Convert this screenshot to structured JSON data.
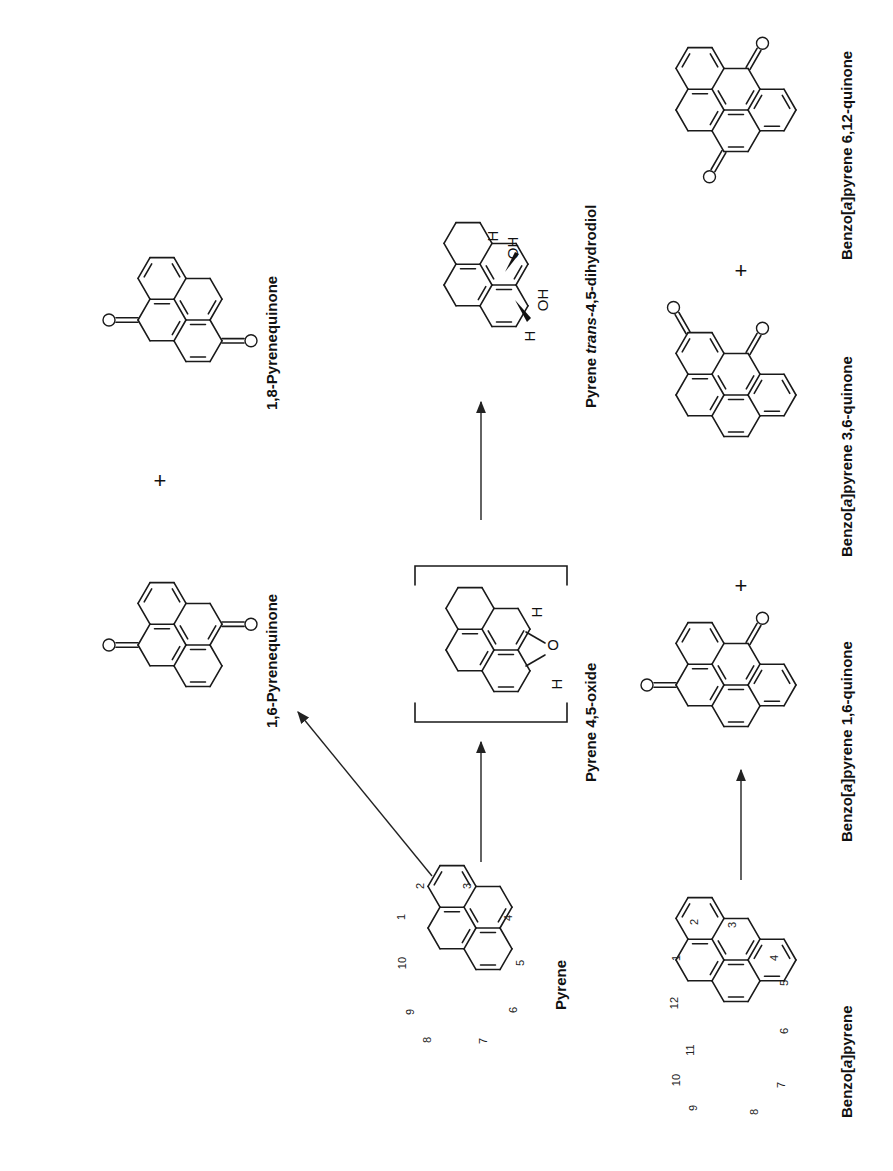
{
  "figure": {
    "orientation": "rotated 90° counter-clockwise",
    "reactions": [
      {
        "from": "Pyrene",
        "to": [
          "1,6-Pyrenequinone",
          "1,8-Pyrenequinone"
        ]
      },
      {
        "from": "Pyrene",
        "to": [
          "Pyrene 4,5-oxide"
        ]
      },
      {
        "from": "Pyrene 4,5-oxide",
        "to": [
          "Pyrene trans-4,5-dihydrodiol"
        ]
      },
      {
        "from": "Benzo[a]pyrene",
        "to": [
          "Benzo[a]pyrene 1,6-quinone",
          "Benzo[a]pyrene 3,6-quinone",
          "Benzo[a]pyrene 6,12-quinone"
        ]
      }
    ]
  },
  "labels": {
    "pyrene": "Pyrene",
    "benzo_a_pyrene_pre": "Benzo[",
    "benzo_a_pyrene_a": "a",
    "benzo_a_pyrene_post": "]pyrene",
    "pyrenequinone_16": "1,6-Pyrenequinone",
    "pyrenequinone_18": "1,8-Pyrenequinone",
    "pyrene_oxide": "Pyrene 4,5-oxide",
    "diol_pre": "Pyrene ",
    "diol_italic": "trans",
    "diol_post": "-4,5-dihydrodiol",
    "bapq16_pre": "Benzo[",
    "bapq16_a": "a",
    "bapq16_post": "]pyrene 1,6-quinone",
    "bapq36_pre": "Benzo[",
    "bapq36_a": "a",
    "bapq36_post": "]pyrene 3,6-quinone",
    "bapq612_pre": "Benzo[",
    "bapq612_a": "a",
    "bapq612_post": "]pyrene 6,12-quinone"
  },
  "plus_signs": [
    "+",
    "+",
    "+"
  ],
  "atoms": {
    "oxygen": "O",
    "hydrogen": "H",
    "hydroxyl": "OH"
  },
  "pyrene_numbering": [
    "1",
    "2",
    "3",
    "4",
    "5",
    "6",
    "7",
    "8",
    "9",
    "10"
  ],
  "bap_numbering": [
    "1",
    "2",
    "3",
    "4",
    "5",
    "6",
    "7",
    "8",
    "9",
    "10",
    "11",
    "12"
  ]
}
